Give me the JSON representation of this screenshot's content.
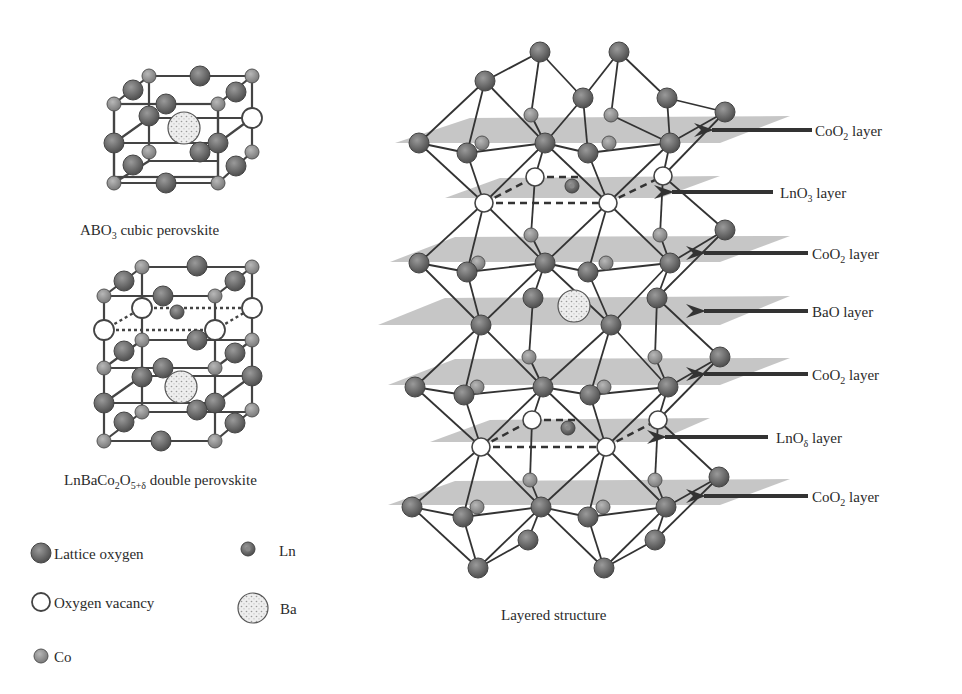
{
  "panels": {
    "cubic": {
      "caption": "ABO",
      "caption_sub": "3",
      "caption_rest": " cubic perovskite"
    },
    "double": {
      "caption": "LnBaCo",
      "caption_sub1": "2",
      "caption_mid": "O",
      "caption_sub2": "5+δ",
      "caption_rest": " double perovskite"
    },
    "layered": {
      "caption": "Layered structure"
    }
  },
  "layers": [
    {
      "base": "CoO",
      "sub": "2",
      "rest": " layer"
    },
    {
      "base": "LnO",
      "sub": "3",
      "rest": " layer"
    },
    {
      "base": "CoO",
      "sub": "2",
      "rest": " layer"
    },
    {
      "base": "BaO",
      "sub": "",
      "rest": " layer"
    },
    {
      "base": "CoO",
      "sub": "2",
      "rest": " layer"
    },
    {
      "base": "LnO",
      "sub": "δ",
      "rest": " layer"
    },
    {
      "base": "CoO",
      "sub": "2",
      "rest": " layer"
    }
  ],
  "legend": [
    {
      "icon": "lattice-oxygen-icon",
      "label": "Lattice oxygen"
    },
    {
      "icon": "ln-icon",
      "label": "Ln"
    },
    {
      "icon": "oxygen-vacancy-icon",
      "label": "Oxygen vacancy"
    },
    {
      "icon": "ba-icon",
      "label": "Ba"
    },
    {
      "icon": "co-icon",
      "label": "Co"
    }
  ],
  "colors": {
    "lattice_oxygen": "#6b6b6b",
    "co": "#8e8e8e",
    "vacancy": "#ffffff",
    "ba": "#e4e4e4",
    "plane": "#bdbdbd",
    "bond": "#333333"
  }
}
